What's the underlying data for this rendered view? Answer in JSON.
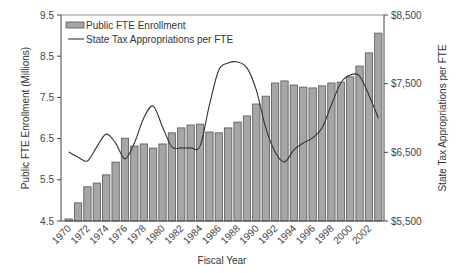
{
  "chart_data": {
    "type": "bar+line",
    "title": "",
    "xlabel": "Fiscal Year",
    "ylabel": "Public FTE Enrollment (Millions)",
    "y2label": "State Tax Appropriations per FTE",
    "ylim": [
      4.5,
      9.5
    ],
    "y2lim": [
      5500,
      8500
    ],
    "yticks": [
      "4.5",
      "5.5",
      "6.5",
      "7.5",
      "8.5",
      "9.5"
    ],
    "y2ticks": [
      "$5,500",
      "$6,500",
      "$7,500",
      "$8,500"
    ],
    "xticks": [
      "1970",
      "1972",
      "1974",
      "1976",
      "1978",
      "1980",
      "1982",
      "1984",
      "1986",
      "1988",
      "1990",
      "1992",
      "1994",
      "1996",
      "1998",
      "2000",
      "2002"
    ],
    "grid": false,
    "legend_position": "top-left",
    "categories": [
      1970,
      1971,
      1972,
      1973,
      1974,
      1975,
      1976,
      1977,
      1978,
      1979,
      1980,
      1981,
      1982,
      1983,
      1984,
      1985,
      1986,
      1987,
      1988,
      1989,
      1990,
      1991,
      1992,
      1993,
      1994,
      1995,
      1996,
      1997,
      1998,
      1999,
      2000,
      2001,
      2002,
      2003
    ],
    "series": [
      {
        "name": "Public FTE  Enrollment",
        "type": "bar",
        "axis": "left",
        "color": "#a6a6a6",
        "values": [
          4.55,
          4.94,
          5.33,
          5.42,
          5.62,
          5.93,
          6.51,
          6.32,
          6.37,
          6.27,
          6.37,
          6.64,
          6.76,
          6.83,
          6.85,
          6.66,
          6.64,
          6.76,
          6.9,
          7.05,
          7.34,
          7.53,
          7.85,
          7.9,
          7.8,
          7.75,
          7.73,
          7.78,
          7.85,
          7.87,
          8.0,
          8.26,
          8.58,
          9.06
        ]
      },
      {
        "name": "State Tax Appropriations per FTE",
        "type": "line",
        "axis": "right",
        "color": "#333333",
        "values": [
          6505,
          6430,
          6375,
          6580,
          6765,
          6635,
          6405,
          6635,
          7000,
          7175,
          6870,
          6580,
          6565,
          6565,
          6590,
          7190,
          7700,
          7800,
          7815,
          7730,
          7405,
          6855,
          6505,
          6360,
          6535,
          6635,
          6710,
          6855,
          7190,
          7510,
          7625,
          7610,
          7335,
          7000
        ]
      }
    ]
  },
  "legend": {
    "items": [
      {
        "label": "Public FTE  Enrollment",
        "icon": "bar-swatch"
      },
      {
        "label": "State Tax Appropriations per FTE",
        "icon": "line-swatch"
      }
    ]
  }
}
